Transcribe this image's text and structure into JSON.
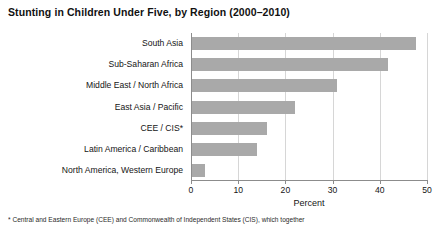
{
  "chart_data": {
    "type": "bar",
    "orientation": "horizontal",
    "title": "Stunting in Children Under Five, by Region (2000–2010)",
    "xlabel": "Percent",
    "ylabel": "",
    "categories": [
      "South Asia",
      "Sub-Saharan Africa",
      "Middle East / North Africa",
      "East Asia / Pacific",
      "CEE / CIS*",
      "Latin America / Caribbean",
      "North America, Western Europe"
    ],
    "values": [
      47.5,
      41.5,
      30.7,
      21.9,
      15.8,
      13.8,
      2.8
    ],
    "xlim": [
      0,
      50
    ],
    "xticks": [
      0,
      10,
      20,
      30,
      40,
      50
    ],
    "xtick_labels": [
      "0",
      "10",
      "20",
      "30",
      "40",
      "50"
    ],
    "grid": "vertical",
    "legend": "none",
    "bar_color": "#a9a9a9",
    "axis_color": "#8c8c8c",
    "gridline_color": "#d6d6d6"
  },
  "footnote": "* Central and Eastern Europe (CEE) and Commonwealth of Independent States (CIS), which together"
}
